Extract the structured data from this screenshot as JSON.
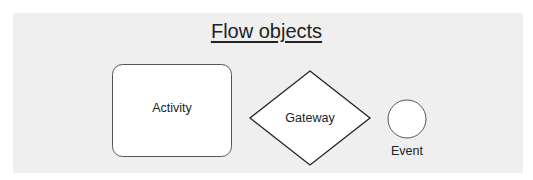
{
  "title": "Flow objects",
  "shapes": {
    "activity": {
      "label": "Activity",
      "shape": "rounded-rectangle"
    },
    "gateway": {
      "label": "Gateway",
      "shape": "diamond"
    },
    "event": {
      "label": "Event",
      "shape": "circle"
    }
  },
  "colors": {
    "panel": "#efefef",
    "stroke": "#333333",
    "fill": "#ffffff",
    "text": "#222222"
  }
}
